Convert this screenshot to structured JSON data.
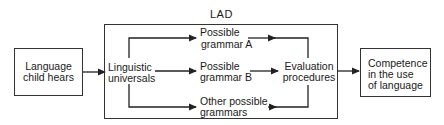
{
  "diagram": {
    "lad_label": "LAD",
    "input_box": {
      "line1": "Language",
      "line2": "child hears"
    },
    "universals": {
      "line1": "Linguistic",
      "line2": "universals"
    },
    "grammar_a": {
      "line1": "Possible",
      "line2": "grammar A"
    },
    "grammar_b": {
      "line1": "Possible",
      "line2": "grammar B"
    },
    "grammar_other": {
      "line1": "Other possible",
      "line2": "grammars"
    },
    "evaluation": {
      "line1": "Evaluation",
      "line2": "procedures"
    },
    "output_box": {
      "line1": "Competence",
      "line2": "in the use",
      "line3": "of language"
    },
    "colors": {
      "line": "#222222",
      "background": "#ffffff",
      "text": "#1a1a1a"
    }
  }
}
